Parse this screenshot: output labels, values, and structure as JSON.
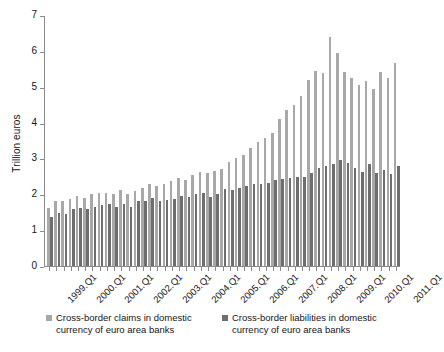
{
  "chart_data": {
    "type": "bar",
    "title": "",
    "subtitle": "",
    "xlabel": "",
    "ylabel": "Trillion euros",
    "ylim": [
      0,
      7
    ],
    "yticks": [
      0,
      1,
      2,
      3,
      4,
      5,
      6,
      7
    ],
    "ytick_labels": [
      "0",
      "1",
      "2",
      "3",
      "4",
      "5",
      "6",
      "7"
    ],
    "grid": false,
    "legend_position": "bottom",
    "x_tick_label_rotation": -45,
    "categories": [
      "1999.Q1",
      "1999.Q2",
      "1999.Q3",
      "1999.Q4",
      "2000.Q1",
      "2000.Q2",
      "2000.Q3",
      "2000.Q4",
      "2001.Q1",
      "2001.Q2",
      "2001.Q3",
      "2001.Q4",
      "2002.Q1",
      "2002.Q2",
      "2002.Q3",
      "2002.Q4",
      "2003.Q1",
      "2003.Q2",
      "2003.Q3",
      "2003.Q4",
      "2004.Q1",
      "2004.Q2",
      "2004.Q3",
      "2004.Q4",
      "2005.Q1",
      "2005.Q2",
      "2005.Q3",
      "2005.Q4",
      "2006.Q1",
      "2006.Q2",
      "2006.Q3",
      "2006.Q4",
      "2007.Q1",
      "2007.Q2",
      "2007.Q3",
      "2007.Q4",
      "2008.Q1",
      "2008.Q2",
      "2008.Q3",
      "2008.Q4",
      "2009.Q1",
      "2009.Q2",
      "2009.Q3",
      "2009.Q4",
      "2010.Q1",
      "2010.Q2",
      "2010.Q3",
      "2010.Q4",
      "2011.Q1"
    ],
    "axis_labels_shown": [
      "1999.Q1",
      "2000.Q1",
      "2001.Q1",
      "2002.Q1",
      "2003.Q1",
      "2004.Q1",
      "2005.Q1",
      "2006.Q1",
      "2007.Q1",
      "2008.Q1",
      "2009.Q1",
      "2010.Q1",
      "2011.Q1"
    ],
    "series": [
      {
        "name": "Cross-border claims in domestic currency of euro area banks",
        "color": "#a8a8a8",
        "values": [
          1.62,
          1.8,
          1.82,
          1.87,
          1.95,
          1.9,
          2.0,
          2.03,
          2.05,
          2.0,
          2.12,
          2.02,
          2.08,
          2.18,
          2.3,
          2.22,
          2.3,
          2.37,
          2.45,
          2.4,
          2.55,
          2.62,
          2.6,
          2.65,
          2.7,
          2.9,
          3.02,
          3.1,
          3.3,
          3.45,
          3.58,
          3.72,
          4.1,
          4.35,
          4.48,
          4.75,
          5.2,
          5.45,
          5.38,
          6.4,
          5.95,
          5.42,
          5.25,
          5.05,
          5.15,
          4.95,
          5.4,
          5.25,
          5.65
        ]
      },
      {
        "name": "Cross-border liabilities in domestic currency of euro area banks",
        "color": "#6e6e6e",
        "values": [
          1.37,
          1.48,
          1.45,
          1.58,
          1.62,
          1.58,
          1.65,
          1.7,
          1.72,
          1.65,
          1.72,
          1.65,
          1.8,
          1.82,
          1.9,
          1.82,
          1.85,
          1.88,
          1.95,
          1.92,
          2.0,
          2.05,
          1.92,
          2.02,
          2.15,
          2.12,
          2.18,
          2.22,
          2.3,
          2.28,
          2.32,
          2.4,
          2.42,
          2.45,
          2.48,
          2.48,
          2.6,
          2.72,
          2.78,
          2.85,
          2.95,
          2.88,
          2.72,
          2.62,
          2.85,
          2.6,
          2.68,
          2.58,
          2.78
        ]
      }
    ]
  },
  "legend": {
    "entries": [
      {
        "label": "Cross-border claims in domestic currency of euro area banks",
        "swatch": "claims-swatch"
      },
      {
        "label": "Cross-border liabilities in domestic currency of euro area banks",
        "swatch": "liabilities-swatch"
      }
    ]
  },
  "colors": {
    "claims": "#a8a8a8",
    "liabilities": "#6e6e6e",
    "axis": "#8b8b8b",
    "text": "#161616",
    "background": "#ffffff"
  }
}
